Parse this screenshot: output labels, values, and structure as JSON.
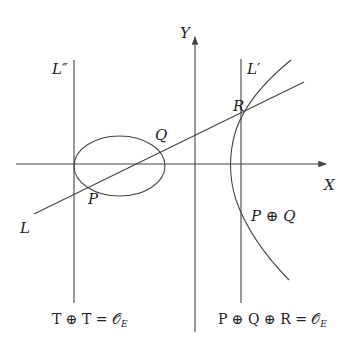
{
  "diagram": {
    "labels": {
      "y_axis": "Y",
      "x_axis": "X",
      "line_L": "L",
      "line_L_prime": "L′",
      "line_L_double_prime": "L″",
      "point_P": "P",
      "point_Q": "Q",
      "point_R": "R",
      "point_P_plus_Q": "P ⊕ Q"
    },
    "equations": {
      "left": "T ⊕ T = 𝒪",
      "left_sub": "E",
      "right": "P ⊕ Q ⊕ R = 𝒪",
      "right_sub": "E"
    },
    "colors": {
      "stroke": "#444444",
      "text": "#222222",
      "background": "#ffffff"
    }
  }
}
